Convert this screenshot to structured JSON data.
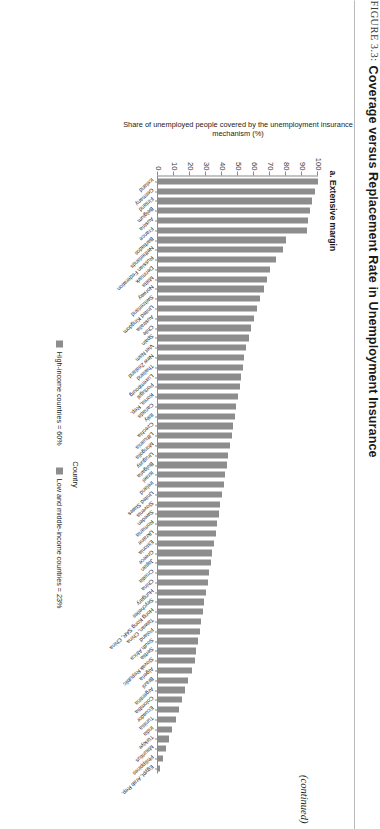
{
  "figure": {
    "label": "FIGURE 3.3:",
    "title": "Coverage versus Replacement Rate in Unemployment Insurance",
    "panel_label": "a. Extensive margin",
    "continued_note": "(continued)"
  },
  "legend": {
    "items": [
      {
        "label": "High-income countries = 60%",
        "color": "#8d8d8d"
      },
      {
        "label": "Low and middle-income countries = 23%",
        "color": "#8d8d8d"
      }
    ]
  },
  "chart_data": {
    "type": "bar",
    "title": "a. Extensive margin",
    "xlabel": "Country",
    "ylabel": "Share of unemployed people covered by the unemployment insurance mechanism (%)",
    "ylim": [
      0,
      100
    ],
    "yticks": [
      0,
      10,
      20,
      30,
      40,
      50,
      60,
      70,
      80,
      90,
      100
    ],
    "grid": false,
    "legend_position": "bottom",
    "categories": [
      "Iceland",
      "Germany",
      "Finland",
      "Belgium",
      "Austria",
      "France",
      "Barbados",
      "Netherlands",
      "Russian Federation",
      "Denmark",
      "Malta",
      "Norway",
      "Switzerland",
      "United Kingdom",
      "Australia",
      "Chile",
      "Spain",
      "Viet Nam",
      "New Zealand",
      "Thailand",
      "Luxembourg",
      "Portugal",
      "Korea, Rep.",
      "Canada",
      "Italy",
      "Czechia",
      "Lithuania",
      "Mongolia",
      "Uruguay",
      "Bulgaria",
      "Israel",
      "Ireland",
      "United States",
      "Slovenia",
      "Sweden",
      "Romania",
      "Ukraine",
      "Estonia",
      "Greece",
      "Japan",
      "Croatia",
      "China",
      "Hungary",
      "Seychelles",
      "Hong Kong SAR, China",
      "Taiwan, China",
      "Poland",
      "South Africa",
      "Serbia",
      "Slovak Republic",
      "Algeria",
      "Brazil",
      "Argentina",
      "Colombia",
      "Ecuador",
      "Tunisia",
      "India",
      "Türkiye",
      "Mauritius",
      "Philippines",
      "Egypt, Arab Rep."
    ],
    "values": [
      100,
      98,
      96,
      95,
      94,
      93,
      80,
      78,
      74,
      70,
      68,
      66,
      64,
      62,
      60,
      58,
      57,
      55,
      54,
      53,
      52,
      51,
      50,
      49,
      48,
      47,
      46,
      45,
      44,
      43,
      42,
      41,
      40,
      39,
      38,
      37,
      36,
      35,
      34,
      33,
      32,
      31,
      30,
      29,
      28,
      27,
      26,
      25,
      24,
      23,
      21,
      19,
      17,
      15,
      13,
      11,
      9,
      7,
      5,
      3,
      1
    ]
  }
}
